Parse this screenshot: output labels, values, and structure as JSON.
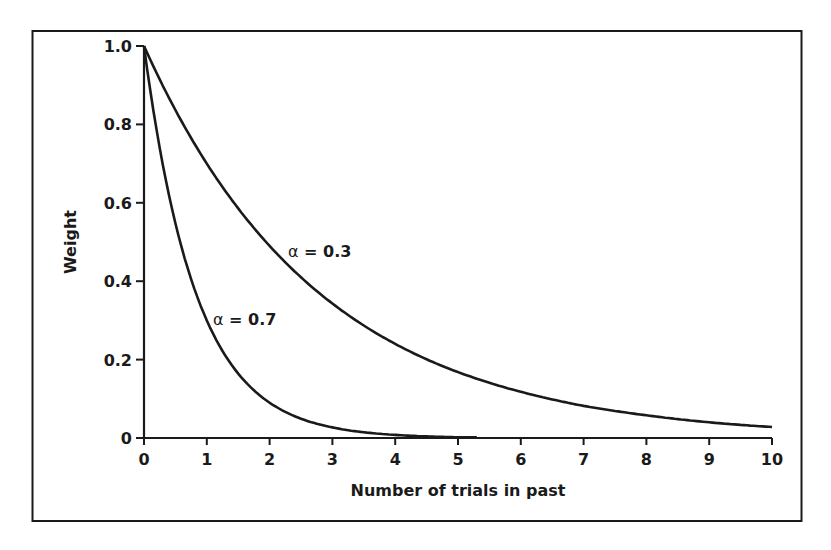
{
  "chart_data": {
    "type": "line",
    "title": "",
    "xlabel": "Number of trials in past",
    "ylabel": "Weight",
    "xlim": [
      0,
      10
    ],
    "ylim": [
      0,
      1.0
    ],
    "x_ticks": [
      0,
      1,
      2,
      3,
      4,
      5,
      6,
      7,
      8,
      9,
      10
    ],
    "x_tick_labels": [
      "0",
      "1",
      "2",
      "3",
      "4",
      "5",
      "6",
      "7",
      "8",
      "9",
      "10"
    ],
    "y_ticks": [
      0,
      0.2,
      0.4,
      0.6,
      0.8,
      1.0
    ],
    "y_tick_labels": [
      "0",
      "0.2",
      "0.4",
      "0.6",
      "0.8",
      "1.0"
    ],
    "grid": false,
    "legend": "none (inline annotations)",
    "series": [
      {
        "name": "α = 0.3",
        "x": [
          0,
          1,
          2,
          3,
          4,
          5,
          6,
          7,
          8,
          9,
          10
        ],
        "values": [
          1.0,
          0.7,
          0.49,
          0.343,
          0.24,
          0.168,
          0.118,
          0.082,
          0.058,
          0.04,
          0.028
        ],
        "x_end": 10
      },
      {
        "name": "α = 0.7",
        "x": [
          0,
          1,
          2,
          3,
          4,
          5,
          5.3
        ],
        "values": [
          1.0,
          0.3,
          0.09,
          0.027,
          0.008,
          0.002,
          0.002
        ],
        "x_end": 5.3
      }
    ],
    "annotations": [
      {
        "text_symbol": "α",
        "text_rest": " = 0.3",
        "x": 2.3,
        "y": 0.47
      },
      {
        "text_symbol": "α",
        "text_rest": " = 0.7",
        "x": 1.15,
        "y": 0.28
      }
    ]
  }
}
